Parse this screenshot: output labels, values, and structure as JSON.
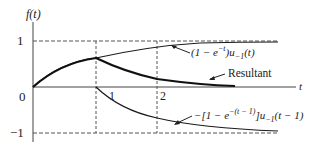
{
  "diagram": {
    "y_axis_label": "f(t)",
    "x_axis_label": "t",
    "y_ticks": [
      {
        "label": "1",
        "value": 1
      },
      {
        "label": "0",
        "value": 0
      },
      {
        "label": "−1",
        "value": -1
      }
    ],
    "x_ticks": [
      {
        "label": "1",
        "value": 1
      },
      {
        "label": "2",
        "value": 2
      }
    ],
    "curves": [
      {
        "name": "positive-step-response",
        "label_main": "(1 − e",
        "label_sup": "−t",
        "label_after": ")u",
        "label_sub": "−1",
        "label_end": "(t)"
      },
      {
        "name": "resultant",
        "label": "Resultant"
      },
      {
        "name": "negative-delayed-step-response",
        "label_main": "−[1 − e",
        "label_sup": "−(t − 1)",
        "label_after": "]u",
        "label_sub": "−1",
        "label_end": "(t − 1)"
      }
    ],
    "colors": {
      "line": "#1a1a1a",
      "dash": "#555555",
      "text": "#222222"
    }
  }
}
